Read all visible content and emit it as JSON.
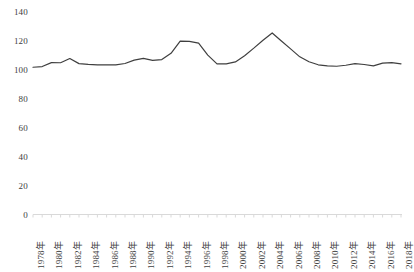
{
  "chart_data": {
    "type": "line",
    "title": "",
    "subtitle": "",
    "xlabel": "",
    "ylabel": "",
    "ylim": [
      0,
      140
    ],
    "yticks": [
      0,
      20,
      40,
      60,
      80,
      100,
      120,
      140
    ],
    "ytick_labels": [
      "0",
      "20",
      "40",
      "60",
      "80",
      "100",
      "120",
      "140"
    ],
    "grid": false,
    "legend": null,
    "legend_position": "none",
    "line_color": "#3f3f3f",
    "axis_color": "#d0d0d0",
    "tick_label_color": "#404040",
    "x": [
      1978,
      1979,
      1980,
      1981,
      1982,
      1983,
      1984,
      1985,
      1986,
      1987,
      1988,
      1989,
      1990,
      1991,
      1992,
      1993,
      1994,
      1995,
      1996,
      1997,
      1998,
      1999,
      2000,
      2001,
      2002,
      2003,
      2004,
      2005,
      2006,
      2007,
      2008,
      2009,
      2010,
      2011,
      2012,
      2013,
      2014,
      2015,
      2016,
      2017,
      2018
    ],
    "categories": [
      "1978年",
      "1979年",
      "1980年",
      "1981年",
      "1982年",
      "1983年",
      "1984年",
      "1985年",
      "1986年",
      "1987年",
      "1988年",
      "1989年",
      "1990年",
      "1991年",
      "1992年",
      "1993年",
      "1994年",
      "1995年",
      "1996年",
      "1997年",
      "1998年",
      "1999年",
      "2000年",
      "2001年",
      "2002年",
      "2003年",
      "2004年",
      "2005年",
      "2006年",
      "2007年",
      "2008年",
      "2009年",
      "2010年",
      "2011年",
      "2012年",
      "2013年",
      "2014年",
      "2015年",
      "2016年",
      "2017年",
      "2018年"
    ],
    "xtick_labels": [
      "1978年",
      "1980年",
      "1982年",
      "1984年",
      "1986年",
      "1988年",
      "1990年",
      "1992年",
      "1994年",
      "1996年",
      "1998年",
      "2000年",
      "2002年",
      "2004年",
      "2006年",
      "2008年",
      "2010年",
      "2012年",
      "2014年",
      "2016年",
      "2018年"
    ],
    "xtick_step": 2,
    "values": [
      101.8,
      102.3,
      105.0,
      104.9,
      107.8,
      104.3,
      103.8,
      103.5,
      103.4,
      103.5,
      104.4,
      106.7,
      107.9,
      106.6,
      107.1,
      111.4,
      119.8,
      119.7,
      118.5,
      110.2,
      104.1,
      104.1,
      105.5,
      109.8,
      115.0,
      120.5,
      125.5,
      120.0,
      114.5,
      109.0,
      105.6,
      103.5,
      102.7,
      102.5,
      103.2,
      104.3,
      103.7,
      102.8,
      104.6,
      105.0,
      104.2
    ],
    "series": [
      {
        "name": "series-1",
        "values": [
          101.8,
          102.3,
          105.0,
          104.9,
          107.8,
          104.3,
          103.8,
          103.5,
          103.4,
          103.5,
          104.4,
          106.7,
          107.9,
          106.6,
          107.1,
          111.4,
          119.8,
          119.7,
          118.5,
          110.2,
          104.1,
          104.1,
          105.5,
          109.8,
          115.0,
          120.5,
          125.5,
          120.0,
          114.5,
          109.0,
          105.6,
          103.5,
          102.7,
          102.5,
          103.2,
          104.3,
          103.7,
          102.8,
          104.6,
          105.0,
          104.2
        ]
      }
    ]
  }
}
